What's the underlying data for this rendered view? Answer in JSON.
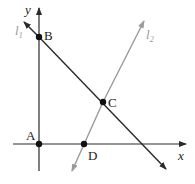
{
  "diagram": {
    "type": "coordinate-geometry",
    "axes": {
      "x_label": "x",
      "y_label": "y",
      "color": "#2a2a2a"
    },
    "lines": [
      {
        "id": "l1",
        "label": "l",
        "subscript": "1",
        "color": "#2a2a2a",
        "from": [
          24,
          22
        ],
        "to": [
          165,
          168
        ]
      },
      {
        "id": "l2",
        "label": "l",
        "subscript": "2",
        "color": "#9a9a9a",
        "from": [
          73,
          170
        ],
        "to": [
          143,
          22
        ]
      }
    ],
    "points": [
      {
        "label": "A",
        "x": 39,
        "y": 144
      },
      {
        "label": "B",
        "x": 39,
        "y": 37
      },
      {
        "label": "C",
        "x": 103,
        "y": 102
      },
      {
        "label": "D",
        "x": 84,
        "y": 144
      }
    ]
  }
}
